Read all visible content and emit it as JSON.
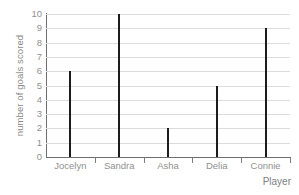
{
  "chart_data": {
    "type": "bar",
    "title": "",
    "categories": [
      "Jocelyn",
      "Sandra",
      "Asha",
      "Delia",
      "Connie"
    ],
    "values": [
      6,
      10,
      2,
      5,
      9
    ],
    "xlabel": "Player",
    "ylabel": "number of goals scored",
    "ylim": [
      0,
      10
    ],
    "ytick_labels": [
      "0",
      "1",
      "2",
      "3",
      "4",
      "5",
      "6",
      "7",
      "8",
      "9",
      "10"
    ],
    "ytick_values": [
      0,
      1,
      2,
      3,
      4,
      5,
      6,
      7,
      8,
      9,
      10
    ],
    "grid": true,
    "grid_axis": "y",
    "legend": false,
    "bar_style": "thin-line",
    "colors": {
      "bar": "#1c1c1c",
      "grid": "#dcdcdc",
      "axis": "#6f6f6f",
      "tick_text": "#8f8f8f",
      "label_text": "#909090",
      "background": "#ffffff"
    }
  }
}
